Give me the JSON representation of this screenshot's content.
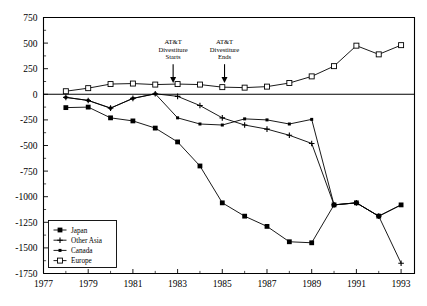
{
  "chart_data": {
    "type": "line",
    "title": "",
    "subtitle": "",
    "xlabel": "",
    "ylabel": "",
    "xlim": [
      1977,
      1993.6
    ],
    "ylim": [
      -1750,
      750
    ],
    "ytick_step": 250,
    "grid": false,
    "legend_position": "bottom-left",
    "xticks": [
      "1977",
      "1979",
      "1981",
      "1983",
      "1985",
      "1987",
      "1989",
      "1991",
      "1993"
    ],
    "xtick_values": [
      1977,
      1979,
      1981,
      1983,
      1985,
      1987,
      1989,
      1991,
      1993
    ],
    "yticks": [
      "750",
      "500",
      "250",
      "0",
      "-250",
      "-500",
      "-750",
      "-1000",
      "-1250",
      "-1500",
      "-1750"
    ],
    "ytick_values": [
      750,
      500,
      250,
      0,
      -250,
      -500,
      -750,
      -1000,
      -1250,
      -1500,
      -1750
    ],
    "x": [
      1978,
      1979,
      1980,
      1981,
      1982,
      1983,
      1984,
      1985,
      1986,
      1987,
      1988,
      1989,
      1990,
      1991,
      1992,
      1993
    ],
    "series": [
      {
        "name": "Japan",
        "marker": "filled-square",
        "values": [
          -130,
          -125,
          -230,
          -260,
          -330,
          -465,
          -700,
          -1060,
          -1190,
          -1290,
          -1440,
          -1450,
          -1080,
          -1060,
          -1190,
          -1080
        ]
      },
      {
        "name": "Other Asia",
        "marker": "plus",
        "values": [
          -30,
          -60,
          -135,
          -40,
          5,
          -20,
          -110,
          -230,
          -300,
          -340,
          -400,
          -480,
          -1080,
          -1060,
          -1190,
          -1650
        ]
      },
      {
        "name": "Canada",
        "marker": "filled-small",
        "values": [
          -30,
          -60,
          -135,
          -40,
          5,
          -230,
          -290,
          -300,
          -240,
          -250,
          -290,
          -245,
          -1080,
          -1060,
          -1190,
          -1080
        ]
      },
      {
        "name": "Europe",
        "marker": "open-square",
        "values": [
          30,
          60,
          100,
          105,
          95,
          100,
          95,
          70,
          65,
          75,
          110,
          175,
          275,
          475,
          390,
          480
        ]
      }
    ],
    "annotations": [
      {
        "id": "att-divestiture-starts",
        "lines": [
          "AT&T",
          "Divestiture",
          "Starts"
        ],
        "x_value": 1982.8,
        "arrow_to_y": 95
      },
      {
        "id": "att-divestiture-ends",
        "lines": [
          "AT&T",
          "Divestiture",
          "Ends"
        ],
        "x_value": 1985.1,
        "arrow_to_y": 95
      }
    ]
  },
  "legend": {
    "items": [
      {
        "label": "Japan",
        "marker": "filled-square"
      },
      {
        "label": "Other Asia",
        "marker": "plus"
      },
      {
        "label": "Canada",
        "marker": "filled-small"
      },
      {
        "label": "Europe",
        "marker": "open-square"
      }
    ]
  },
  "colors": {
    "axis": "#000000",
    "series": "#000000",
    "background": "#ffffff"
  }
}
